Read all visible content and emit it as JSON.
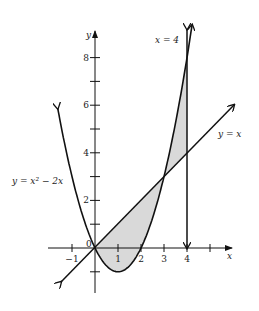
{
  "figure": {
    "x_axis_label": "x",
    "y_axis_label": "y",
    "origin_label": "0",
    "x_ticks": [
      {
        "value": -1,
        "label": "−1"
      },
      {
        "value": 1,
        "label": "1"
      },
      {
        "value": 2,
        "label": "2"
      },
      {
        "value": 3,
        "label": "3"
      },
      {
        "value": 4,
        "label": "4"
      },
      {
        "value": 5,
        "label": ""
      }
    ],
    "y_ticks": [
      {
        "value": -1,
        "label": ""
      },
      {
        "value": 1,
        "label": ""
      },
      {
        "value": 2,
        "label": "2"
      },
      {
        "value": 3,
        "label": ""
      },
      {
        "value": 4,
        "label": "4"
      },
      {
        "value": 5,
        "label": ""
      },
      {
        "value": 6,
        "label": "6"
      },
      {
        "value": 7,
        "label": ""
      },
      {
        "value": 8,
        "label": "8"
      }
    ],
    "curves": {
      "parabola_label": "y = x² − 2x",
      "line_label": "y = x",
      "vertical_label": "x = 4"
    },
    "shaded_region": "between y = x and y = x² − 2x from x = 0 to x = 4",
    "colors": {
      "stroke": "#111111",
      "shade": "#d9d9d9"
    }
  }
}
